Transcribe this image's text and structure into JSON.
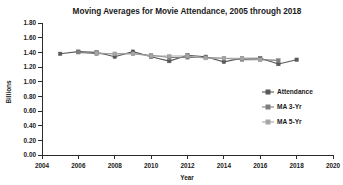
{
  "chart_data": {
    "type": "line",
    "title": "Moving Averages for Movie Attendance, 2005 through 2018",
    "xlabel": "Year",
    "ylabel": "Billions",
    "xlim": [
      2004,
      2020
    ],
    "ylim": [
      0.0,
      1.8
    ],
    "xticks": [
      2004,
      2006,
      2008,
      2010,
      2012,
      2014,
      2016,
      2018,
      2020
    ],
    "xtick_labels": [
      "2004",
      "2006",
      "2008",
      "2010",
      "2012",
      "2014",
      "2016",
      "2018",
      "2020"
    ],
    "yticks": [
      0.0,
      0.2,
      0.4,
      0.6,
      0.8,
      1.0,
      1.2,
      1.4,
      1.6,
      1.8
    ],
    "ytick_labels": [
      "0.00",
      "0.20",
      "0.40",
      "0.60",
      "0.80",
      "1.00",
      "1.20",
      "1.40",
      "1.60",
      "1.80"
    ],
    "grid": false,
    "legend_position": "right-middle",
    "x": [
      2005,
      2006,
      2007,
      2008,
      2009,
      2010,
      2011,
      2012,
      2013,
      2014,
      2015,
      2016,
      2017,
      2018
    ],
    "series": [
      {
        "name": "Attendance",
        "color": "#595959",
        "marker": "square",
        "values": [
          1.38,
          1.41,
          1.4,
          1.34,
          1.41,
          1.34,
          1.28,
          1.36,
          1.34,
          1.27,
          1.32,
          1.32,
          1.24,
          1.3
        ]
      },
      {
        "name": "MA 3-Yr",
        "color": "#7f7f7f",
        "marker": "square",
        "values": [
          null,
          1.4,
          1.38,
          1.38,
          1.38,
          1.36,
          1.33,
          1.33,
          1.33,
          1.32,
          1.3,
          1.3,
          1.29,
          null
        ]
      },
      {
        "name": "MA 5-Yr",
        "color": "#a6a6a6",
        "marker": "square",
        "values": [
          null,
          null,
          1.39,
          1.38,
          1.38,
          1.35,
          1.35,
          1.35,
          1.32,
          1.32,
          1.32,
          1.3,
          null,
          null
        ]
      }
    ]
  },
  "legend": {
    "items": [
      {
        "label": "Attendance"
      },
      {
        "label": "MA 3-Yr"
      },
      {
        "label": "MA 5-Yr"
      }
    ]
  }
}
